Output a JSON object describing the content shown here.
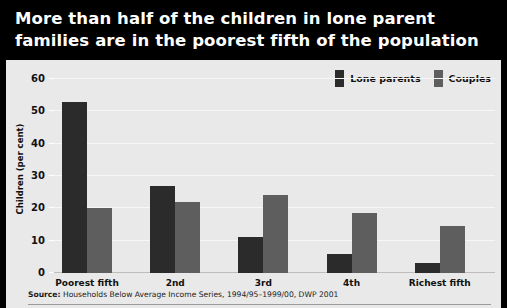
{
  "title": {
    "line1": "More than half of the children in lone parent",
    "line2": "families are in the poorest fifth of the population"
  },
  "legend": {
    "items": [
      {
        "label": "Lone parents",
        "color": "#2b2b2b",
        "key": "lone_parents"
      },
      {
        "label": "Couples",
        "color": "#5e5e5e",
        "key": "couples"
      }
    ]
  },
  "source": {
    "prefix": "Source:",
    "text": " Households Below Average Income Series, 1994/95–1999/00, DWP 2001"
  },
  "colors": {
    "title_background": "#000000",
    "title_text": "#ffffff",
    "panel_background": "#e9e9e9",
    "lone_parents": "#2b2b2b",
    "couples": "#5e5e5e",
    "gridline": "#f7f7f7",
    "axis": "#bdbdbd"
  },
  "chart_data": {
    "type": "bar",
    "title": "More than half of the children in lone parent families are in the poorest fifth of the population",
    "subtitle": "",
    "xlabel": "",
    "ylabel": "Children (per cent)",
    "ylim": [
      0,
      60
    ],
    "yticks": [
      0,
      10,
      20,
      30,
      40,
      50,
      60
    ],
    "ytick_labels": [
      "0",
      "10",
      "20",
      "30",
      "40",
      "50",
      "60"
    ],
    "grid": true,
    "legend_position": "top-right",
    "categories": [
      "Poorest fifth",
      "2nd",
      "3rd",
      "4th",
      "Richest fifth"
    ],
    "series": [
      {
        "name": "Lone parents",
        "color": "#2b2b2b",
        "values": [
          53,
          27,
          11,
          6,
          3
        ]
      },
      {
        "name": "Couples",
        "color": "#5e5e5e",
        "values": [
          20,
          22,
          24,
          18.5,
          14.5
        ]
      }
    ],
    "annotations": [],
    "source": "Source: Households Below Average Income Series, 1994/95–1999/00, DWP 2001"
  }
}
